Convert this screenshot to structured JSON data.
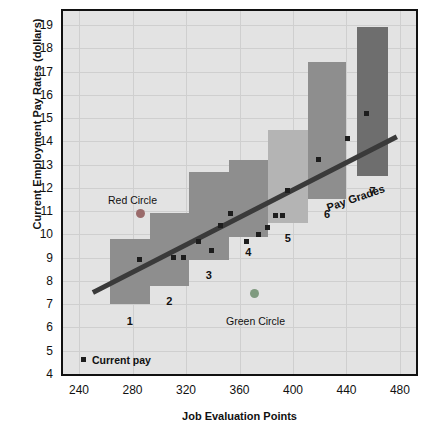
{
  "chart_data": {
    "type": "bar",
    "title": "",
    "xlabel": "Job Evaluation Points",
    "ylabel": "Current Employment Pay Rates (dollars)",
    "xlim": [
      228,
      492
    ],
    "ylim": [
      4,
      19.6
    ],
    "xticks": [
      240,
      280,
      320,
      360,
      400,
      440,
      480
    ],
    "yticks": [
      4,
      5,
      6,
      7,
      8,
      9,
      10,
      11,
      12,
      13,
      14,
      15,
      16,
      17,
      18,
      19
    ],
    "grid": true,
    "legend": [
      {
        "name": "Current pay",
        "marker": "square",
        "color": "#1d1d1d"
      }
    ],
    "series": [
      {
        "name": "Pay Grade Ranges",
        "type": "bar",
        "unit": "dollars",
        "bars": [
          {
            "grade": "1",
            "x_min": 263,
            "x_max": 293,
            "pay_min": 7.0,
            "pay_max": 9.8,
            "color": "#8e8e8e"
          },
          {
            "grade": "2",
            "x_min": 293,
            "x_max": 322,
            "pay_min": 7.8,
            "pay_max": 10.9,
            "color": "#8e8e8e"
          },
          {
            "grade": "3",
            "x_min": 322,
            "x_max": 352,
            "pay_min": 8.9,
            "pay_max": 12.7,
            "color": "#8e8e8e"
          },
          {
            "grade": "4",
            "x_min": 352,
            "x_max": 381,
            "pay_min": 9.9,
            "pay_max": 13.2,
            "color": "#8e8e8e"
          },
          {
            "grade": "5",
            "x_min": 381,
            "x_max": 411,
            "pay_min": 10.5,
            "pay_max": 14.5,
            "color": "#b4b4b4"
          },
          {
            "grade": "6",
            "x_min": 411,
            "x_max": 440,
            "pay_min": 11.5,
            "pay_max": 17.4,
            "color": "#8e8e8e"
          },
          {
            "grade": "7",
            "x_min": 448,
            "x_max": 471,
            "pay_min": 12.5,
            "pay_max": 18.9,
            "color": "#6e6e6e"
          }
        ]
      },
      {
        "name": "Trend line",
        "type": "line",
        "color": "#3a3a3a",
        "points": [
          {
            "x": 252,
            "y": 7.55
          },
          {
            "x": 476,
            "y": 14.15
          }
        ]
      },
      {
        "name": "Current pay",
        "type": "scatter",
        "color": "#1d1d1d",
        "points": [
          {
            "x": 285,
            "y": 8.9
          },
          {
            "x": 311,
            "y": 9.0
          },
          {
            "x": 318,
            "y": 9.0
          },
          {
            "x": 329,
            "y": 9.7
          },
          {
            "x": 339,
            "y": 9.3
          },
          {
            "x": 346,
            "y": 10.4
          },
          {
            "x": 353,
            "y": 10.9
          },
          {
            "x": 365,
            "y": 9.7
          },
          {
            "x": 374,
            "y": 10.0
          },
          {
            "x": 381,
            "y": 10.3
          },
          {
            "x": 387,
            "y": 10.8
          },
          {
            "x": 392,
            "y": 10.8
          },
          {
            "x": 396,
            "y": 11.9
          },
          {
            "x": 419,
            "y": 13.2
          },
          {
            "x": 441,
            "y": 14.1
          },
          {
            "x": 455,
            "y": 15.2
          }
        ]
      },
      {
        "name": "Outliers",
        "type": "scatter",
        "points": [
          {
            "x": 286,
            "y": 10.9,
            "label": "Red Circle",
            "color": "#9a6b6b"
          },
          {
            "x": 371,
            "y": 7.45,
            "label": "Green Circle",
            "color": "#7f9a7f"
          }
        ]
      }
    ],
    "annotations": [
      {
        "text": "Red Circle",
        "x": 280,
        "y": 11.7
      },
      {
        "text": "Green Circle",
        "x": 372,
        "y": 6.5
      },
      {
        "text": "Pay Grades",
        "x": 424,
        "y": 11.4,
        "rotated": true
      }
    ]
  },
  "axes": {
    "y_title": "Current Employment Pay Rates (dollars)",
    "x_title": "Job Evaluation Points",
    "y_tick_labels": [
      "19",
      "18",
      "17",
      "16",
      "15",
      "14",
      "13",
      "12",
      "11",
      "10",
      "9",
      "8",
      "7",
      "6",
      "5",
      "4"
    ],
    "x_tick_labels": [
      "240",
      "280",
      "320",
      "360",
      "400",
      "440",
      "480"
    ]
  },
  "legend": {
    "current_pay_label": "Current pay"
  },
  "grade_labels": [
    "1",
    "2",
    "3",
    "4",
    "5",
    "6",
    "7"
  ],
  "annotations": {
    "red_circle": "Red Circle",
    "green_circle": "Green Circle",
    "pay_grades": "Pay Grades"
  },
  "colors": {
    "plot_background": "#e3e3e3",
    "grid": "#cfcfcf",
    "frame": "#111111",
    "bar_mid": "#8e8e8e",
    "bar_light": "#b4b4b4",
    "bar_dark": "#6e6e6e",
    "marker": "#1d1d1d",
    "trend": "#3a3a3a",
    "red_circle": "#9a6b6b",
    "green_circle": "#7f9a7f"
  }
}
